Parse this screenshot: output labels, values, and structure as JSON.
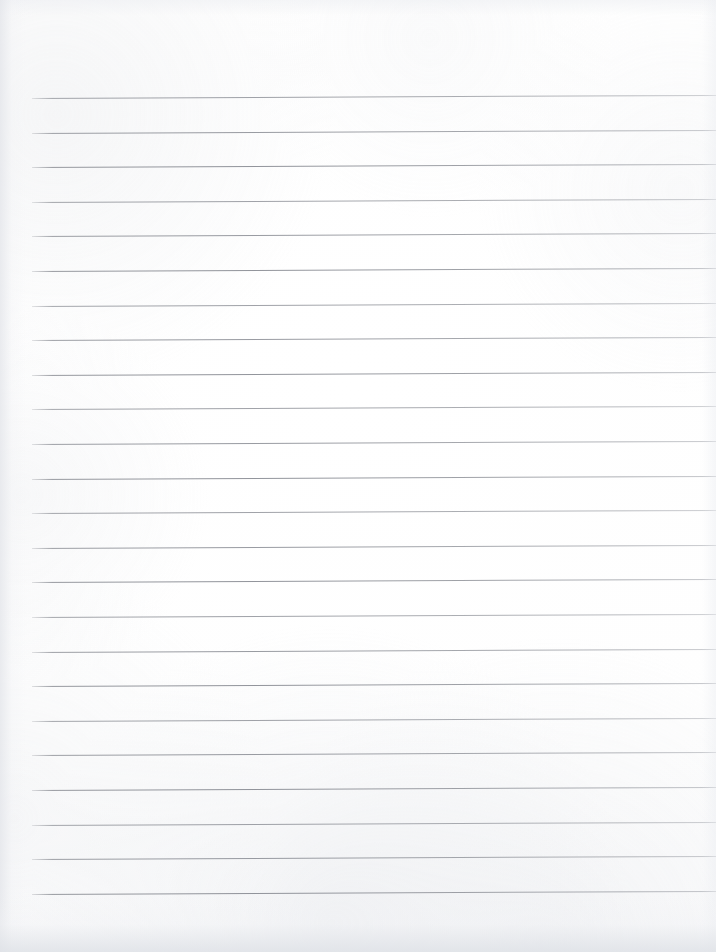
{
  "document": {
    "kind": "ruled-notebook-paper",
    "title": "",
    "page_width": 716,
    "page_height": 952,
    "background_color": "#ffffff",
    "paper_tint": "#fdfdfe",
    "content_text": "",
    "is_blank": true
  },
  "ruling": {
    "line_color": "#85888f",
    "line_thickness_px": 1,
    "line_count": 24,
    "first_line_y": 98,
    "line_spacing_px": 34.6,
    "left_margin_x": 32,
    "right_edge_x": 716,
    "tilt_degrees": -0.26,
    "lines_y": [
      98,
      132.6,
      167.2,
      201.8,
      236.4,
      271,
      305.6,
      340.2,
      374.8,
      409.4,
      444,
      478.6,
      513.2,
      547.8,
      582.4,
      617,
      651.6,
      686.2,
      720.8,
      755.4,
      790,
      824.6,
      859.2,
      893.8
    ]
  },
  "edges": {
    "left_shadow_color": "#e2e4e9",
    "bottom_shadow_color": "#dfe2e7",
    "top_shadow_color": "#ebedf1",
    "right_shadow_color": "#eceef2"
  }
}
